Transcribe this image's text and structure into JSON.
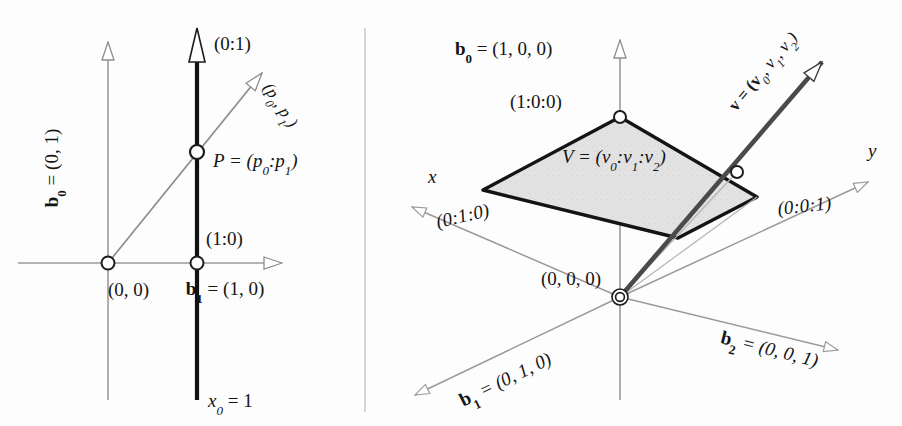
{
  "figure": {
    "divider": "vertical-rule",
    "colors": {
      "axis_gray": "#9a9a9a",
      "ink_black": "#141414",
      "ray_gray": "#8e8e8e",
      "plane_fill": "#dedede",
      "vector_dark": "#4a4a4a"
    }
  },
  "left_panel": {
    "name": "projective-line-diagram",
    "labels": {
      "b0_axis": "b",
      "b0_sub": "0",
      "b0_eq": " = (0, 1)",
      "b1_axis": "b",
      "b1_sub": "1",
      "b1_eq": " = (1, 0)",
      "point_infinity": "(0:1)",
      "ray_vector": "(p",
      "ray_vector_sub0": "0",
      "ray_vector_mid": ", p",
      "ray_vector_sub1": "1",
      "ray_vector_end": ")",
      "point_P": "P = (p",
      "point_P_sub0": "0",
      "point_P_colon": ":p",
      "point_P_sub1": "1",
      "point_P_end": ")",
      "point_one_zero": "(1:0)",
      "origin": "(0, 0)",
      "line_equation": "x",
      "line_equation_sub": "0",
      "line_equation_rest": " = 1"
    }
  },
  "right_panel": {
    "name": "projective-plane-diagram",
    "labels": {
      "b0_axis": "b",
      "b0_sub": "0",
      "b0_eq": " = (1, 0, 0)",
      "b0_proj": "(1:0:0)",
      "b1_axis": "b",
      "b1_sub": "1",
      "b1_eq": " = (0, 1, 0)",
      "b1_proj": "(0:1:0)",
      "b2_axis": "b",
      "b2_sub": "2",
      "b2_eq": " = (0, 0, 1)",
      "b2_proj": "(0:0:1)",
      "axis_x": "x",
      "axis_y": "y",
      "origin": "(0, 0, 0)",
      "point_V": "V = (v",
      "point_V_sub0": "0",
      "point_V_c1": ":v",
      "point_V_sub1": "1",
      "point_V_c2": ":v",
      "point_V_sub2": "2",
      "point_V_end": ")",
      "vector_v": "v = (v",
      "vector_v_sub0": "0",
      "vector_v_m1": ", v",
      "vector_v_sub1": "1",
      "vector_v_m2": ", v",
      "vector_v_sub2": "2",
      "vector_v_end": ")"
    }
  }
}
